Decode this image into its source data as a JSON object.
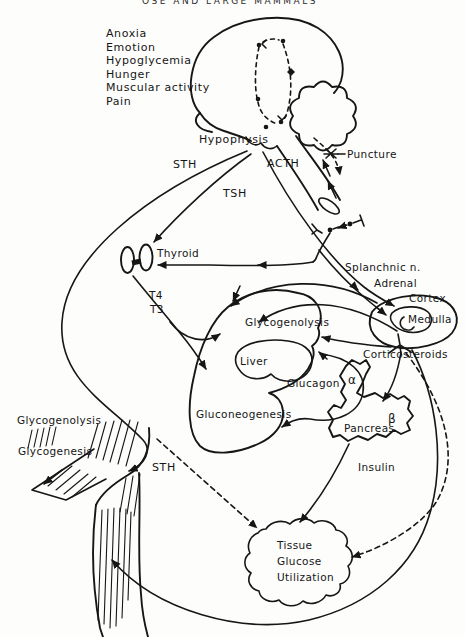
{
  "figure": {
    "header_fragment": "OSE AND LARGE MAMMALS",
    "background_color": "#fdfdfc",
    "ink_color": "#161616",
    "stimuli": [
      "Anoxia",
      "Emotion",
      "Hypoglycemia",
      "Hunger",
      "Muscular activity",
      "Pain"
    ],
    "labels": {
      "hypophysis": "Hypophysis",
      "puncture": "Puncture",
      "sth_pituitary": "STH",
      "acth": "ACTH",
      "tsh": "TSH",
      "thyroid": "Thyroid",
      "t4": "T4",
      "t3": "T3",
      "splanchnic_nerve": "Splanchnic n.",
      "adrenal": "Adrenal",
      "cortex": "Cortex",
      "medulla": "Medulla",
      "liver_glycogenolysis": "Glycogenolysis",
      "liver": "Liver",
      "glucagon": "Glucagon",
      "corticosteroids": "Corticosteroids",
      "gluconeogenesis": "Gluconeogenesis",
      "pancreas": "Pancreas",
      "alpha_cells": "α",
      "beta_cells": "β",
      "muscle_glycogenolysis": "Glycogenolysis",
      "muscle_glycogenesis": "Glycogenesis",
      "sth_muscle": "STH",
      "insulin": "Insulin",
      "tissue_line1": "Tissue",
      "tissue_line2": "Glucose",
      "tissue_line3": "Utilization"
    }
  }
}
